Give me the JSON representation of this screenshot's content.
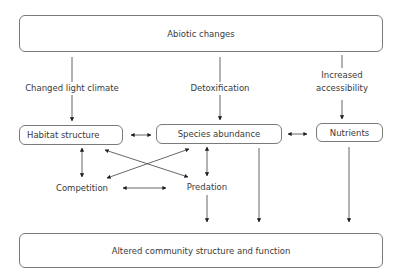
{
  "diagram": {
    "nodes": {
      "abiotic": "Abiotic changes",
      "habitat": "Habitat structure",
      "species": "Species abundance",
      "nutrients": "Nutrients",
      "competition": "Competition",
      "predation": "Predation",
      "outcome": "Altered community structure and function"
    },
    "edge_labels": {
      "light": "Changed light climate",
      "detox": "Detoxification",
      "access_line1": "Increased",
      "access_line2": "accessibility"
    },
    "edges": [
      {
        "from": "Abiotic changes",
        "to": "Habitat structure",
        "label": "Changed light climate",
        "type": "directed"
      },
      {
        "from": "Abiotic changes",
        "to": "Species abundance",
        "label": "Detoxification",
        "type": "directed"
      },
      {
        "from": "Abiotic changes",
        "to": "Nutrients",
        "label": "Increased accessibility",
        "type": "directed"
      },
      {
        "from": "Habitat structure",
        "to": "Species abundance",
        "type": "bidirectional"
      },
      {
        "from": "Species abundance",
        "to": "Nutrients",
        "type": "bidirectional"
      },
      {
        "from": "Habitat structure",
        "to": "Competition",
        "type": "bidirectional"
      },
      {
        "from": "Habitat structure",
        "to": "Predation",
        "type": "bidirectional"
      },
      {
        "from": "Species abundance",
        "to": "Competition",
        "type": "bidirectional"
      },
      {
        "from": "Species abundance",
        "to": "Predation",
        "type": "bidirectional"
      },
      {
        "from": "Competition",
        "to": "Predation",
        "type": "bidirectional"
      },
      {
        "from": "Predation",
        "to": "Altered community structure and function",
        "type": "directed"
      },
      {
        "from": "Species abundance",
        "to": "Altered community structure and function",
        "type": "directed"
      },
      {
        "from": "Nutrients",
        "to": "Altered community structure and function",
        "type": "directed"
      }
    ]
  }
}
